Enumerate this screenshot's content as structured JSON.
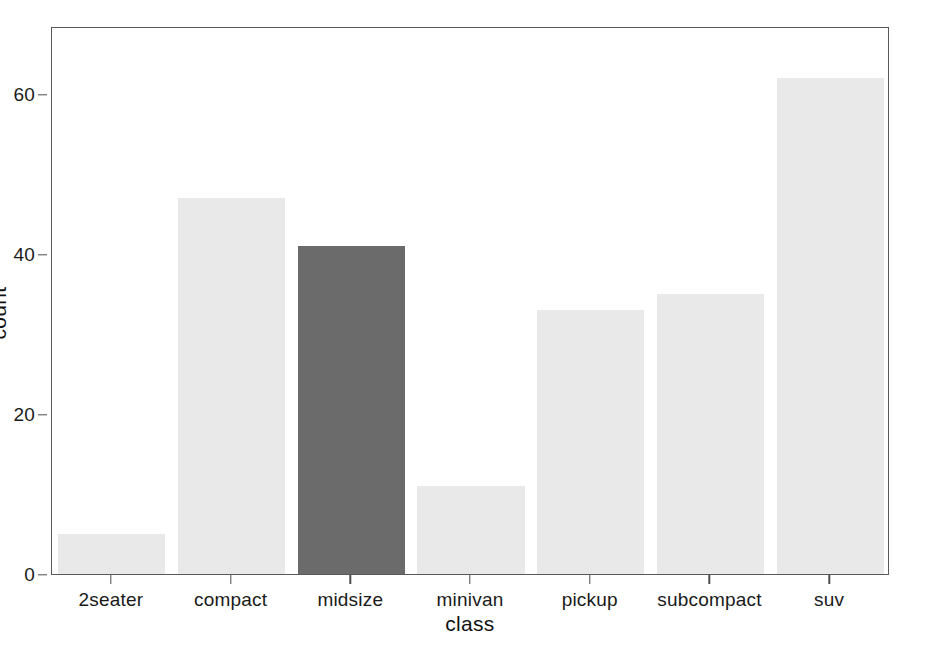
{
  "chart_data": {
    "type": "bar",
    "title": "",
    "subtitle": "",
    "xlabel": "class",
    "ylabel": "count",
    "categories": [
      "2seater",
      "compact",
      "midsize",
      "minivan",
      "pickup",
      "subcompact",
      "suv"
    ],
    "values": [
      5,
      47,
      41,
      11,
      33,
      35,
      62
    ],
    "ylim": [
      0,
      68.5
    ],
    "y_ticks": [
      0,
      20,
      40,
      60
    ],
    "y_tick_labels": [
      "0",
      "20",
      "40",
      "60"
    ],
    "x_tick_labels": [
      "2seater",
      "compact",
      "midsize",
      "minivan",
      "pickup",
      "subcompact",
      "suv"
    ],
    "grid": false,
    "legend": null,
    "legend_position": "none",
    "highlighted_category": "midsize",
    "bar_colors": [
      "#e9e9e9",
      "#e9e9e9",
      "#6b6b6b",
      "#e9e9e9",
      "#e9e9e9",
      "#e9e9e9",
      "#e9e9e9"
    ]
  },
  "style": {
    "bar_fill_default": "#e9e9e9",
    "bar_fill_highlight": "#6b6b6b",
    "panel_background": "#ffffff",
    "panel_border": "#595959",
    "axis_text": "#1a1a1a",
    "axis_title": "#111111",
    "tick_mark": "#4d4d4d",
    "figure_background": "#ffffff"
  }
}
